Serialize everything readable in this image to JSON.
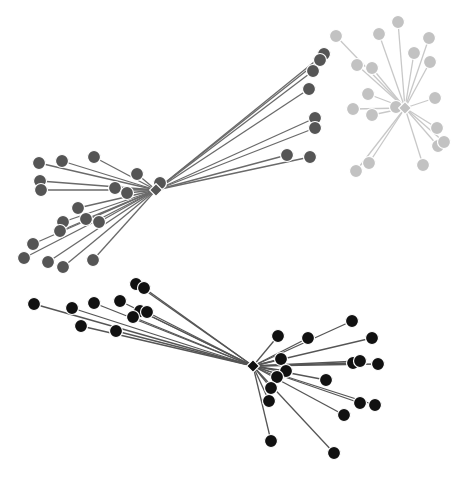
{
  "diagram": {
    "type": "network",
    "width": 464,
    "height": 481,
    "node_radius": 6.5,
    "hub_size": 9,
    "clusters": [
      {
        "name": "light-gray-cluster",
        "color": "#c2c2c2",
        "edge_color": "#c8c8c8",
        "hub": {
          "x": 405,
          "y": 108
        },
        "leaves": [
          {
            "x": 336,
            "y": 36
          },
          {
            "x": 398,
            "y": 22
          },
          {
            "x": 379,
            "y": 34
          },
          {
            "x": 429,
            "y": 38
          },
          {
            "x": 414,
            "y": 53
          },
          {
            "x": 430,
            "y": 62
          },
          {
            "x": 357,
            "y": 65
          },
          {
            "x": 372,
            "y": 68
          },
          {
            "x": 368,
            "y": 94
          },
          {
            "x": 435,
            "y": 98
          },
          {
            "x": 353,
            "y": 109
          },
          {
            "x": 372,
            "y": 115
          },
          {
            "x": 396,
            "y": 107
          },
          {
            "x": 437,
            "y": 128
          },
          {
            "x": 438,
            "y": 146
          },
          {
            "x": 444,
            "y": 142
          },
          {
            "x": 369,
            "y": 163
          },
          {
            "x": 356,
            "y": 171
          },
          {
            "x": 423,
            "y": 165
          }
        ]
      },
      {
        "name": "dark-gray-cluster",
        "color": "#555555",
        "edge_color": "#6a6a6a",
        "hub": {
          "x": 156,
          "y": 190
        },
        "leaves": [
          {
            "x": 324,
            "y": 54
          },
          {
            "x": 320,
            "y": 60
          },
          {
            "x": 313,
            "y": 71
          },
          {
            "x": 309,
            "y": 89
          },
          {
            "x": 315,
            "y": 118
          },
          {
            "x": 315,
            "y": 128
          },
          {
            "x": 287,
            "y": 155
          },
          {
            "x": 310,
            "y": 157
          },
          {
            "x": 39,
            "y": 163
          },
          {
            "x": 62,
            "y": 161
          },
          {
            "x": 94,
            "y": 157
          },
          {
            "x": 137,
            "y": 174
          },
          {
            "x": 160,
            "y": 183
          },
          {
            "x": 40,
            "y": 181
          },
          {
            "x": 41,
            "y": 190
          },
          {
            "x": 115,
            "y": 188
          },
          {
            "x": 127,
            "y": 193
          },
          {
            "x": 78,
            "y": 208
          },
          {
            "x": 63,
            "y": 222
          },
          {
            "x": 86,
            "y": 219
          },
          {
            "x": 99,
            "y": 222
          },
          {
            "x": 60,
            "y": 231
          },
          {
            "x": 33,
            "y": 244
          },
          {
            "x": 24,
            "y": 258
          },
          {
            "x": 48,
            "y": 262
          },
          {
            "x": 63,
            "y": 267
          },
          {
            "x": 93,
            "y": 260
          }
        ]
      },
      {
        "name": "black-cluster",
        "color": "#111111",
        "edge_color": "#555555",
        "hub": {
          "x": 253,
          "y": 366
        },
        "leaves": [
          {
            "x": 34,
            "y": 304
          },
          {
            "x": 72,
            "y": 308
          },
          {
            "x": 94,
            "y": 303
          },
          {
            "x": 120,
            "y": 301
          },
          {
            "x": 136,
            "y": 284
          },
          {
            "x": 144,
            "y": 288
          },
          {
            "x": 140,
            "y": 311
          },
          {
            "x": 147,
            "y": 312
          },
          {
            "x": 133,
            "y": 317
          },
          {
            "x": 81,
            "y": 326
          },
          {
            "x": 116,
            "y": 331
          },
          {
            "x": 278,
            "y": 336
          },
          {
            "x": 308,
            "y": 338
          },
          {
            "x": 352,
            "y": 321
          },
          {
            "x": 372,
            "y": 338
          },
          {
            "x": 281,
            "y": 359
          },
          {
            "x": 353,
            "y": 363
          },
          {
            "x": 360,
            "y": 361
          },
          {
            "x": 378,
            "y": 364
          },
          {
            "x": 286,
            "y": 371
          },
          {
            "x": 277,
            "y": 377
          },
          {
            "x": 326,
            "y": 380
          },
          {
            "x": 271,
            "y": 388
          },
          {
            "x": 269,
            "y": 401
          },
          {
            "x": 360,
            "y": 403
          },
          {
            "x": 375,
            "y": 405
          },
          {
            "x": 344,
            "y": 415
          },
          {
            "x": 271,
            "y": 441
          },
          {
            "x": 334,
            "y": 453
          }
        ]
      }
    ]
  }
}
